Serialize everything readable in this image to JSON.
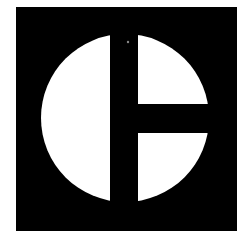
{
  "logo": {
    "name": "circle-split-mark",
    "colors": {
      "background": "#ffffff",
      "square": "#000000",
      "circle": "#ffffff",
      "bars": "#000000"
    }
  }
}
